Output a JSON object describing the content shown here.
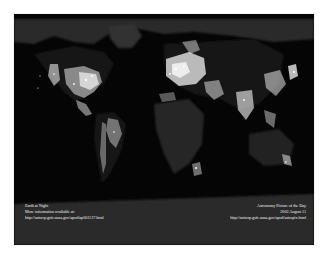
{
  "image": {
    "subject": "Earth at Night - composite satellite map of city lights",
    "background_color": "#050505",
    "page_background": "#ffffff"
  },
  "caption_left": {
    "title": "Earth at Night",
    "line2": "More information available at:",
    "url": "http://antwrp.gsfc.nasa.gov/apod/ap001127.html"
  },
  "caption_right": {
    "title": "Astronomy Picture of the Day",
    "date": "2002 August 11",
    "url": "http://antwrp.gsfc.nasa.gov/apod/astropix.html"
  }
}
